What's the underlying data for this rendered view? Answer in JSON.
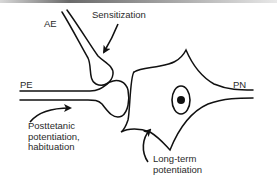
{
  "diagram": {
    "labels": {
      "ae": "AE",
      "pe": "PE",
      "pn": "PN",
      "sensitization": "Sensitization",
      "posttetanic": "Posttetanic\npotentiation,\nhabituation",
      "long_term": "Long-term\npotentiation"
    },
    "components": [
      {
        "id": "ae",
        "description": "Axon ending (modulatory terminal) descending from upper left"
      },
      {
        "id": "pe",
        "description": "Presynaptic ending entering from left"
      },
      {
        "id": "pn",
        "description": "Postsynaptic neuron with nucleus, axon exiting right"
      }
    ],
    "arrows": [
      {
        "from": "sensitization",
        "to": "ae-terminal"
      },
      {
        "from": "posttetanic",
        "to": "pe-terminal"
      },
      {
        "from": "long_term",
        "to": "pn-membrane"
      }
    ],
    "colors": {
      "stroke": "#111111",
      "text": "#2a2a2a",
      "background": "#ffffff"
    }
  }
}
